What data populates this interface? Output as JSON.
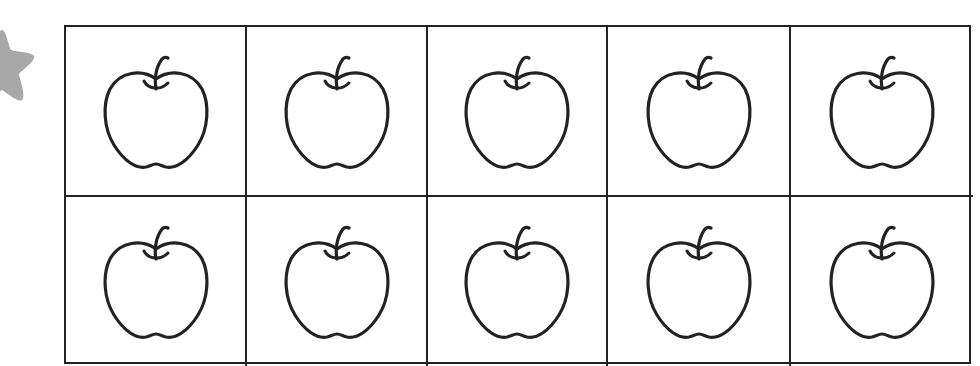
{
  "worksheet": {
    "ten_frame": {
      "rows": 2,
      "columns": 5,
      "cells": [
        {
          "item": "apple"
        },
        {
          "item": "apple"
        },
        {
          "item": "apple"
        },
        {
          "item": "apple"
        },
        {
          "item": "apple"
        },
        {
          "item": "apple"
        },
        {
          "item": "apple"
        },
        {
          "item": "apple"
        },
        {
          "item": "apple"
        },
        {
          "item": "apple"
        }
      ],
      "count": 10
    },
    "decoration": {
      "icon": "star-icon",
      "color": "#a8a8a8"
    },
    "colors": {
      "line": "#222222",
      "background": "#ffffff"
    }
  }
}
